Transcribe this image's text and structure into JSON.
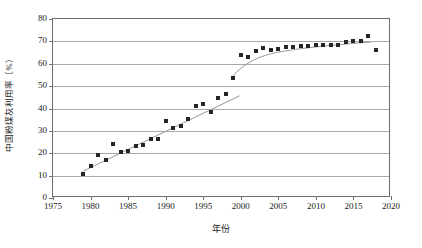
{
  "chart_data": {
    "type": "scatter",
    "title": "",
    "xlabel": "年份",
    "ylabel": "中国粉煤灰利用率（%）",
    "xlim": [
      1975,
      2020
    ],
    "ylim": [
      0,
      80
    ],
    "xticks": [
      1975,
      1980,
      1985,
      1990,
      1995,
      2000,
      2005,
      2010,
      2015,
      2020
    ],
    "yticks": [
      0,
      10,
      20,
      30,
      40,
      50,
      60,
      70,
      80
    ],
    "grid": "horizontal",
    "legend": "none",
    "marker": "filled-square",
    "marker_color": "#252525",
    "trendline_color": "#8a8a8a",
    "series": [
      {
        "name": "中国粉煤灰利用率",
        "points": [
          {
            "x": 1979,
            "y": 10.8
          },
          {
            "x": 1980,
            "y": 14.3
          },
          {
            "x": 1981,
            "y": 19.1
          },
          {
            "x": 1982,
            "y": 16.9
          },
          {
            "x": 1983,
            "y": 24.3
          },
          {
            "x": 1984,
            "y": 20.6
          },
          {
            "x": 1985,
            "y": 21.2
          },
          {
            "x": 1986,
            "y": 23.2
          },
          {
            "x": 1987,
            "y": 23.8
          },
          {
            "x": 1988,
            "y": 26.3
          },
          {
            "x": 1989,
            "y": 26.3
          },
          {
            "x": 1990,
            "y": 34.4
          },
          {
            "x": 1991,
            "y": 31.3
          },
          {
            "x": 1992,
            "y": 32.1
          },
          {
            "x": 1993,
            "y": 35.2
          },
          {
            "x": 1994,
            "y": 41.1
          },
          {
            "x": 1995,
            "y": 42.1
          },
          {
            "x": 1996,
            "y": 38.4
          },
          {
            "x": 1997,
            "y": 44.6
          },
          {
            "x": 1998,
            "y": 46.7
          },
          {
            "x": 1999,
            "y": 53.8
          },
          {
            "x": 2000,
            "y": 64.0
          },
          {
            "x": 2001,
            "y": 63.2
          },
          {
            "x": 2002,
            "y": 65.8
          },
          {
            "x": 2003,
            "y": 67.2
          },
          {
            "x": 2004,
            "y": 66.1
          },
          {
            "x": 2005,
            "y": 66.4
          },
          {
            "x": 2006,
            "y": 67.4
          },
          {
            "x": 2007,
            "y": 67.5
          },
          {
            "x": 2008,
            "y": 67.8
          },
          {
            "x": 2009,
            "y": 68.1
          },
          {
            "x": 2010,
            "y": 68.3
          },
          {
            "x": 2011,
            "y": 68.2
          },
          {
            "x": 2012,
            "y": 68.2
          },
          {
            "x": 2013,
            "y": 68.4
          },
          {
            "x": 2014,
            "y": 69.6
          },
          {
            "x": 2015,
            "y": 70.1
          },
          {
            "x": 2016,
            "y": 70.3
          },
          {
            "x": 2017,
            "y": 72.6
          },
          {
            "x": 2018,
            "y": 66.2
          }
        ]
      }
    ],
    "trendlines": [
      {
        "name": "linear-fit-1979-2000",
        "kind": "line",
        "points": [
          {
            "x": 1979.0,
            "y": 11.2
          },
          {
            "x": 2000.0,
            "y": 45.3
          }
        ]
      },
      {
        "name": "saturating-fit-1999-2017",
        "kind": "curve",
        "points": [
          {
            "x": 1998.8,
            "y": 53.2
          },
          {
            "x": 1999.6,
            "y": 56.0
          },
          {
            "x": 2000.5,
            "y": 58.6
          },
          {
            "x": 2001.5,
            "y": 60.8
          },
          {
            "x": 2002.5,
            "y": 62.4
          },
          {
            "x": 2003.5,
            "y": 63.6
          },
          {
            "x": 2004.5,
            "y": 64.5
          },
          {
            "x": 2006.0,
            "y": 65.5
          },
          {
            "x": 2008.0,
            "y": 66.5
          },
          {
            "x": 2010.0,
            "y": 67.3
          },
          {
            "x": 2012.0,
            "y": 68.0
          },
          {
            "x": 2014.0,
            "y": 68.6
          },
          {
            "x": 2016.0,
            "y": 69.2
          },
          {
            "x": 2017.6,
            "y": 69.6
          }
        ]
      }
    ]
  }
}
